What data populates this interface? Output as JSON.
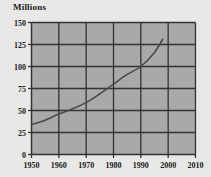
{
  "chart_data": {
    "type": "line",
    "title": "",
    "ylabel": "Millions",
    "xlabel": "",
    "xlim": [
      1950,
      2010
    ],
    "ylim": [
      0,
      150
    ],
    "grid": true,
    "legend": null,
    "xticks": [
      1950,
      1960,
      1970,
      1980,
      1990,
      2000,
      2010
    ],
    "yticks": [
      0,
      25,
      50,
      75,
      100,
      125,
      150
    ],
    "series": [
      {
        "name": "population",
        "x": [
          1950,
          1955,
          1960,
          1965,
          1970,
          1975,
          1980,
          1985,
          1990,
          1995,
          1998
        ],
        "values": [
          34,
          39,
          46,
          52,
          59,
          69,
          80,
          91,
          100,
          116,
          131
        ]
      }
    ],
    "colors": {
      "plot_background": "#a9a9a9",
      "grid": "#333333",
      "line": "#4a4a4a",
      "axis_text": "#1a1a1a",
      "page_background": "#e8e8e6"
    }
  }
}
